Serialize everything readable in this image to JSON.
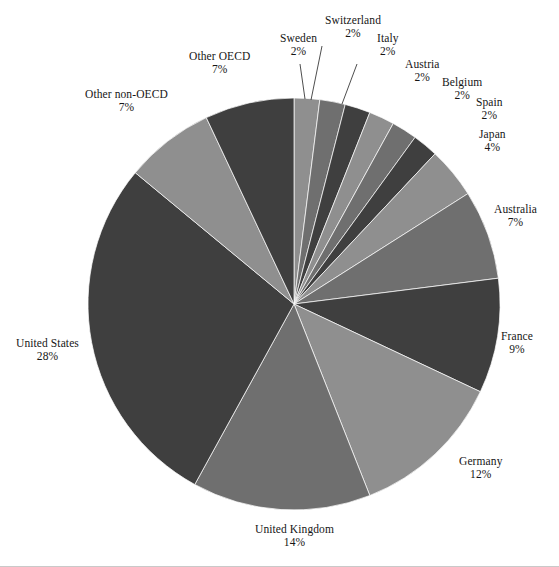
{
  "page": {
    "background_color": "#ffffff",
    "width": 559,
    "height": 567
  },
  "chart_data": {
    "type": "pie",
    "title": "",
    "subtitle": "",
    "xlabel": "",
    "ylabel": "",
    "legend_position": "none",
    "labels_position": "outside-with-leader-lines",
    "start_angle_deg": 0,
    "direction": "clockwise",
    "center": {
      "x": 294,
      "y": 304
    },
    "radius": 206,
    "categories": [
      "Sweden",
      "Switzerland",
      "Italy",
      "Austria",
      "Belgium",
      "Spain",
      "Japan",
      "Australia",
      "France",
      "Germany",
      "United Kingdom",
      "United States",
      "Other non-OECD",
      "Other OECD"
    ],
    "values": [
      2,
      2,
      2,
      2,
      2,
      2,
      4,
      7,
      9,
      12,
      14,
      28,
      7,
      7
    ],
    "value_labels": [
      "2%",
      "2%",
      "2%",
      "2%",
      "2%",
      "2%",
      "4%",
      "7%",
      "9%",
      "12%",
      "14%",
      "28%",
      "7%",
      "7%"
    ],
    "units": "percent",
    "total": 100,
    "slices": [
      {
        "name": "Sweden",
        "value": 2,
        "value_label": "2%",
        "color": "#8f8f8f"
      },
      {
        "name": "Switzerland",
        "value": 2,
        "value_label": "2%",
        "color": "#6f6f6f"
      },
      {
        "name": "Italy",
        "value": 2,
        "value_label": "2%",
        "color": "#3f3f3f"
      },
      {
        "name": "Austria",
        "value": 2,
        "value_label": "2%",
        "color": "#8f8f8f"
      },
      {
        "name": "Belgium",
        "value": 2,
        "value_label": "2%",
        "color": "#6f6f6f"
      },
      {
        "name": "Spain",
        "value": 2,
        "value_label": "2%",
        "color": "#3f3f3f"
      },
      {
        "name": "Japan",
        "value": 4,
        "value_label": "4%",
        "color": "#8f8f8f"
      },
      {
        "name": "Australia",
        "value": 7,
        "value_label": "7%",
        "color": "#6f6f6f"
      },
      {
        "name": "France",
        "value": 9,
        "value_label": "9%",
        "color": "#3f3f3f"
      },
      {
        "name": "Germany",
        "value": 12,
        "value_label": "12%",
        "color": "#8f8f8f"
      },
      {
        "name": "United Kingdom",
        "value": 14,
        "value_label": "14%",
        "color": "#6f6f6f"
      },
      {
        "name": "United States",
        "value": 28,
        "value_label": "28%",
        "color": "#3f3f3f"
      },
      {
        "name": "Other non-OECD",
        "value": 7,
        "value_label": "7%",
        "color": "#8f8f8f"
      },
      {
        "name": "Other OECD",
        "value": 7,
        "value_label": "7%",
        "color": "#3f3f3f"
      }
    ]
  },
  "labels": [
    {
      "key": "switzerland",
      "name": "Switzerland",
      "pct": "2%",
      "x": 353,
      "y": 14,
      "leader": true,
      "lx": 322,
      "ly": 46,
      "tx": 311,
      "ty": 100
    },
    {
      "key": "sweden",
      "name": "Sweden",
      "pct": "2%",
      "x": 298,
      "y": 32,
      "leader": true,
      "lx": 300,
      "ly": 64,
      "tx": 305,
      "ty": 99
    },
    {
      "key": "italy",
      "name": "Italy",
      "pct": "2%",
      "x": 388,
      "y": 32,
      "leader": true,
      "lx": 357,
      "ly": 64,
      "tx": 342,
      "ty": 104
    },
    {
      "key": "austria",
      "name": "Austria",
      "pct": "2%",
      "x": 422,
      "y": 58,
      "leader": false,
      "lx": 0,
      "ly": 0,
      "tx": 0,
      "ty": 0
    },
    {
      "key": "other-oecd",
      "name": "Other OECD",
      "pct": "7%",
      "x": 219,
      "y": 50,
      "leader": false,
      "lx": 0,
      "ly": 0,
      "tx": 0,
      "ty": 0
    },
    {
      "key": "belgium",
      "name": "Belgium",
      "pct": "2%",
      "x": 462,
      "y": 76,
      "leader": false,
      "lx": 0,
      "ly": 0,
      "tx": 0,
      "ty": 0
    },
    {
      "key": "spain",
      "name": "Spain",
      "pct": "2%",
      "x": 489,
      "y": 96,
      "leader": false,
      "lx": 0,
      "ly": 0,
      "tx": 0,
      "ty": 0
    },
    {
      "key": "other-non-oecd",
      "name": "Other non-OECD",
      "pct": "7%",
      "x": 126,
      "y": 88,
      "leader": false,
      "lx": 0,
      "ly": 0,
      "tx": 0,
      "ty": 0
    },
    {
      "key": "japan",
      "name": "Japan",
      "pct": "4%",
      "x": 492,
      "y": 128,
      "leader": false,
      "lx": 0,
      "ly": 0,
      "tx": 0,
      "ty": 0
    },
    {
      "key": "australia",
      "name": "Australia",
      "pct": "7%",
      "x": 515,
      "y": 203,
      "leader": false,
      "lx": 0,
      "ly": 0,
      "tx": 0,
      "ty": 0
    },
    {
      "key": "france",
      "name": "France",
      "pct": "9%",
      "x": 517,
      "y": 330,
      "leader": false,
      "lx": 0,
      "ly": 0,
      "tx": 0,
      "ty": 0
    },
    {
      "key": "germany",
      "name": "Germany",
      "pct": "12%",
      "x": 481,
      "y": 455,
      "leader": false,
      "lx": 0,
      "ly": 0,
      "tx": 0,
      "ty": 0
    },
    {
      "key": "united-kingdom",
      "name": "United Kingdom",
      "pct": "14%",
      "x": 294,
      "y": 523,
      "leader": false,
      "lx": 0,
      "ly": 0,
      "tx": 0,
      "ty": 0
    },
    {
      "key": "united-states",
      "name": "United States",
      "pct": "28%",
      "x": 47,
      "y": 337,
      "leader": false,
      "lx": 0,
      "ly": 0,
      "tx": 0,
      "ty": 0
    }
  ]
}
